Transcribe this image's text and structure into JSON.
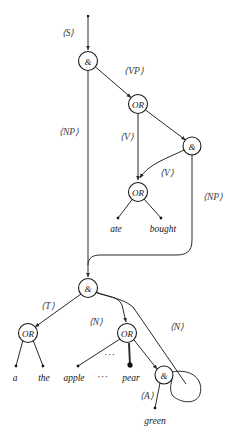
{
  "figure": {
    "kind": "grammar-flow-graph",
    "background_color": "#ffffff",
    "stroke_color": "#2a2a2a",
    "label_color": "#3a3a3a",
    "width": 239,
    "height": 441
  },
  "nodes": [
    {
      "id": "and-s",
      "label": "&",
      "type": "and",
      "x": 88,
      "y": 61,
      "r": 9.5
    },
    {
      "id": "or-vp",
      "label": "OR",
      "type": "or",
      "x": 138,
      "y": 104,
      "r": 9.5
    },
    {
      "id": "and-vp",
      "label": "&",
      "type": "and",
      "x": 192,
      "y": 146,
      "r": 9.0
    },
    {
      "id": "or-v",
      "label": "OR",
      "type": "or",
      "x": 138,
      "y": 192,
      "r": 9.5
    },
    {
      "id": "and-np",
      "label": "&",
      "type": "and",
      "x": 88,
      "y": 288,
      "r": 9.5
    },
    {
      "id": "or-t",
      "label": "OR",
      "type": "or",
      "x": 28,
      "y": 333,
      "r": 9.5
    },
    {
      "id": "or-n",
      "label": "OR",
      "type": "or",
      "x": 127,
      "y": 333,
      "r": 9.5
    },
    {
      "id": "and-n",
      "label": "&",
      "type": "and",
      "x": 164,
      "y": 375,
      "r": 9.0
    }
  ],
  "nonterminal_labels": [
    {
      "id": "label-s",
      "text": "⟨S⟩",
      "x": 68,
      "y": 33
    },
    {
      "id": "label-vp",
      "text": "⟨VP⟩",
      "x": 134,
      "y": 71
    },
    {
      "id": "label-np1",
      "text": "⟨NP⟩",
      "x": 69,
      "y": 132
    },
    {
      "id": "label-v1",
      "text": "⟨V⟩",
      "x": 127,
      "y": 137
    },
    {
      "id": "label-v2",
      "text": "⟨V⟩",
      "x": 167,
      "y": 173
    },
    {
      "id": "label-np2",
      "text": "⟨NP⟩",
      "x": 213,
      "y": 197
    },
    {
      "id": "label-t",
      "text": "⟨T⟩",
      "x": 48,
      "y": 306
    },
    {
      "id": "label-n1",
      "text": "⟨N⟩",
      "x": 96,
      "y": 322
    },
    {
      "id": "label-n2",
      "text": "⟨N⟩",
      "x": 177,
      "y": 327
    },
    {
      "id": "label-a",
      "text": "⟨A⟩",
      "x": 147,
      "y": 396
    }
  ],
  "terminals": [
    {
      "id": "term-ate",
      "text": "ate",
      "x": 116,
      "y": 229
    },
    {
      "id": "term-bought",
      "text": "bought",
      "x": 163,
      "y": 229
    },
    {
      "id": "term-a",
      "text": "a",
      "x": 15,
      "y": 378
    },
    {
      "id": "term-the",
      "text": "the",
      "x": 44,
      "y": 378
    },
    {
      "id": "term-apple",
      "text": "apple",
      "x": 74,
      "y": 378
    },
    {
      "id": "term-pear",
      "text": "pear",
      "x": 131,
      "y": 378
    },
    {
      "id": "term-green",
      "text": "green",
      "x": 155,
      "y": 421
    }
  ],
  "ellipses": [
    {
      "id": "dots-terminals",
      "text": "···",
      "x": 103,
      "y": 377
    },
    {
      "id": "dots-branch",
      "text": "···",
      "x": 110,
      "y": 355
    }
  ],
  "caption": {
    "text": ""
  }
}
